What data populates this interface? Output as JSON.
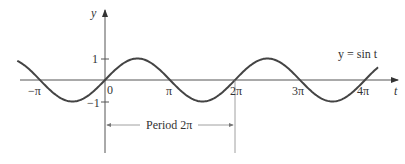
{
  "chart_data": {
    "type": "line",
    "title": "",
    "function": "y = sin t",
    "xlabel": "t",
    "ylabel": "y",
    "x_ticks": [
      "−π",
      "0",
      "π",
      "2π",
      "3π",
      "4π"
    ],
    "y_ticks": [
      "1",
      "−1"
    ],
    "xlim": [
      -4.0,
      4.4
    ],
    "ylim": [
      -1,
      1
    ],
    "curve_label": "y = sin t",
    "annotation": "Period 2π",
    "series": [
      {
        "name": "sin t",
        "x_range_pi": [
          -1.35,
          4.2
        ]
      }
    ]
  },
  "labels": {
    "y_axis": "y",
    "t_axis": "t",
    "origin": "0",
    "neg_pi": "−π",
    "pi": "π",
    "two_pi": "2π",
    "three_pi": "3π",
    "four_pi": "4π",
    "one": "1",
    "neg_one": "−1",
    "curve": "y = sin t",
    "period": "Period 2π"
  }
}
